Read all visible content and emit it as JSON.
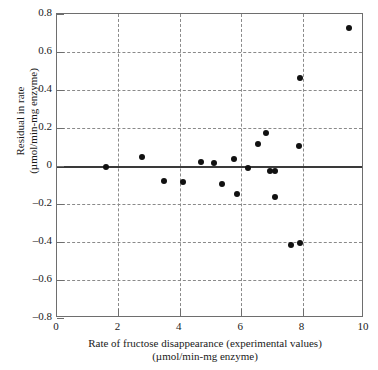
{
  "chart_data": {
    "type": "scatter",
    "title": "",
    "xlabel": "Rate of fructose disappearance (experimental values) (µmol/min-mg enzyme)",
    "ylabel": "Residual in rate (µmol/min-mg enzyme)",
    "xlabel_lines": [
      "Rate of fructose disappearance (experimental values)",
      "(µmol/min-mg enzyme)"
    ],
    "ylabel_lines": [
      "Residual in rate",
      "(µmol/min-mg enzyme)"
    ],
    "xlim": [
      0,
      10
    ],
    "ylim": [
      -0.8,
      0.8
    ],
    "xticks": [
      0,
      2,
      4,
      6,
      8,
      10
    ],
    "yticks": [
      0.8,
      0.6,
      0.4,
      0.2,
      0,
      -0.2,
      -0.4,
      -0.6,
      -0.8
    ],
    "xtick_labels": [
      "0",
      "2",
      "4",
      "6",
      "8",
      "10"
    ],
    "ytick_labels": [
      "0.8",
      "0.6",
      "0.4",
      "0.2",
      "0",
      "–0.2",
      "–0.4",
      "–0.6",
      "–0.8"
    ],
    "grid": true,
    "grid_style": "dashed",
    "grid_color": "#8a8a8a",
    "legend": null,
    "reference_line": {
      "y": 0,
      "style": "solid",
      "color": "#3a3a3a",
      "width": 2
    },
    "marker": {
      "shape": "circle",
      "filled": true,
      "color": "#111111",
      "size": 6
    },
    "points": [
      {
        "x": 1.58,
        "y": -0.005
      },
      {
        "x": 2.78,
        "y": 0.045
      },
      {
        "x": 3.47,
        "y": -0.08
      },
      {
        "x": 4.12,
        "y": -0.082
      },
      {
        "x": 4.7,
        "y": 0.022
      },
      {
        "x": 5.13,
        "y": 0.018
      },
      {
        "x": 5.37,
        "y": -0.095
      },
      {
        "x": 5.78,
        "y": 0.035
      },
      {
        "x": 5.87,
        "y": -0.145
      },
      {
        "x": 6.22,
        "y": -0.01
      },
      {
        "x": 6.55,
        "y": 0.115
      },
      {
        "x": 6.8,
        "y": 0.172
      },
      {
        "x": 6.95,
        "y": -0.025
      },
      {
        "x": 7.1,
        "y": -0.028
      },
      {
        "x": 7.1,
        "y": -0.162
      },
      {
        "x": 7.62,
        "y": -0.418
      },
      {
        "x": 7.88,
        "y": 0.105
      },
      {
        "x": 7.9,
        "y": 0.462
      },
      {
        "x": 7.93,
        "y": -0.405
      },
      {
        "x": 9.5,
        "y": 0.725
      }
    ]
  }
}
